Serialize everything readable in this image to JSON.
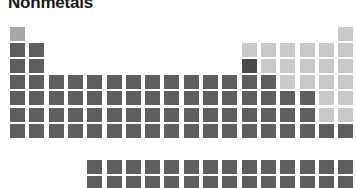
{
  "title": "Nonmetals",
  "chart_data": {
    "type": "heatmap",
    "title": "Nonmetals",
    "subtitle": "",
    "xlabel": "",
    "ylabel": "",
    "legend": [
      {
        "label": "Nonmetal (highlighted)",
        "color": "#c9c9c9"
      },
      {
        "label": "Other element",
        "color": "#5e5e5e"
      }
    ],
    "legend_position": "none",
    "grid": false,
    "colors": {
      "highlight": "#c9c9c9",
      "highlight_mid": "#a8a8a8",
      "base": "#5e5e5e",
      "base_dark": "#4a4a4a",
      "background": "#ffffff",
      "title": "#1a1a1a"
    },
    "layout": {
      "columns": 18,
      "rows": 10,
      "origin_x": 10,
      "origin_y": 27,
      "pitch_x": 19.3,
      "pitch_y": 16.1,
      "cell_w": 15,
      "cell_h": 14,
      "fblock_row_gap": 4,
      "fblock_start_col": 3
    },
    "categories": [
      "col1",
      "col2",
      "col3",
      "col4",
      "col5",
      "col6",
      "col7",
      "col8",
      "col9",
      "col10",
      "col11",
      "col12",
      "col13",
      "col14",
      "col15",
      "col16",
      "col17",
      "col18"
    ],
    "cells": [
      {
        "symbol": "H",
        "z": 1,
        "col": 1,
        "row": 1,
        "value": 1,
        "tone": "highlight_mid"
      },
      {
        "symbol": "He",
        "z": 2,
        "col": 18,
        "row": 1,
        "value": 1,
        "tone": "highlight"
      },
      {
        "symbol": "Li",
        "z": 3,
        "col": 1,
        "row": 2,
        "value": 0,
        "tone": "base"
      },
      {
        "symbol": "Be",
        "z": 4,
        "col": 2,
        "row": 2,
        "value": 0,
        "tone": "base"
      },
      {
        "symbol": "B",
        "z": 5,
        "col": 13,
        "row": 2,
        "value": 1,
        "tone": "highlight"
      },
      {
        "symbol": "C",
        "z": 6,
        "col": 14,
        "row": 2,
        "value": 1,
        "tone": "highlight"
      },
      {
        "symbol": "N",
        "z": 7,
        "col": 15,
        "row": 2,
        "value": 1,
        "tone": "highlight"
      },
      {
        "symbol": "O",
        "z": 8,
        "col": 16,
        "row": 2,
        "value": 1,
        "tone": "highlight"
      },
      {
        "symbol": "F",
        "z": 9,
        "col": 17,
        "row": 2,
        "value": 1,
        "tone": "highlight"
      },
      {
        "symbol": "Ne",
        "z": 10,
        "col": 18,
        "row": 2,
        "value": 1,
        "tone": "highlight"
      },
      {
        "symbol": "Na",
        "z": 11,
        "col": 1,
        "row": 3,
        "value": 0,
        "tone": "base"
      },
      {
        "symbol": "Mg",
        "z": 12,
        "col": 2,
        "row": 3,
        "value": 0,
        "tone": "base"
      },
      {
        "symbol": "Al",
        "z": 13,
        "col": 13,
        "row": 3,
        "value": 0,
        "tone": "base_dark"
      },
      {
        "symbol": "Si",
        "z": 14,
        "col": 14,
        "row": 3,
        "value": 1,
        "tone": "highlight"
      },
      {
        "symbol": "P",
        "z": 15,
        "col": 15,
        "row": 3,
        "value": 1,
        "tone": "highlight"
      },
      {
        "symbol": "S",
        "z": 16,
        "col": 16,
        "row": 3,
        "value": 1,
        "tone": "highlight"
      },
      {
        "symbol": "Cl",
        "z": 17,
        "col": 17,
        "row": 3,
        "value": 1,
        "tone": "highlight"
      },
      {
        "symbol": "Ar",
        "z": 18,
        "col": 18,
        "row": 3,
        "value": 1,
        "tone": "highlight"
      },
      {
        "symbol": "K",
        "z": 19,
        "col": 1,
        "row": 4,
        "value": 0,
        "tone": "base"
      },
      {
        "symbol": "Ca",
        "z": 20,
        "col": 2,
        "row": 4,
        "value": 0,
        "tone": "base"
      },
      {
        "symbol": "Sc",
        "z": 21,
        "col": 3,
        "row": 4,
        "value": 0,
        "tone": "base"
      },
      {
        "symbol": "Ti",
        "z": 22,
        "col": 4,
        "row": 4,
        "value": 0,
        "tone": "base"
      },
      {
        "symbol": "V",
        "z": 23,
        "col": 5,
        "row": 4,
        "value": 0,
        "tone": "base"
      },
      {
        "symbol": "Cr",
        "z": 24,
        "col": 6,
        "row": 4,
        "value": 0,
        "tone": "base"
      },
      {
        "symbol": "Mn",
        "z": 25,
        "col": 7,
        "row": 4,
        "value": 0,
        "tone": "base"
      },
      {
        "symbol": "Fe",
        "z": 26,
        "col": 8,
        "row": 4,
        "value": 0,
        "tone": "base"
      },
      {
        "symbol": "Co",
        "z": 27,
        "col": 9,
        "row": 4,
        "value": 0,
        "tone": "base"
      },
      {
        "symbol": "Ni",
        "z": 28,
        "col": 10,
        "row": 4,
        "value": 0,
        "tone": "base"
      },
      {
        "symbol": "Cu",
        "z": 29,
        "col": 11,
        "row": 4,
        "value": 0,
        "tone": "base"
      },
      {
        "symbol": "Zn",
        "z": 30,
        "col": 12,
        "row": 4,
        "value": 0,
        "tone": "base"
      },
      {
        "symbol": "Ga",
        "z": 31,
        "col": 13,
        "row": 4,
        "value": 0,
        "tone": "base"
      },
      {
        "symbol": "Ge",
        "z": 32,
        "col": 14,
        "row": 4,
        "value": 0,
        "tone": "base"
      },
      {
        "symbol": "As",
        "z": 33,
        "col": 15,
        "row": 4,
        "value": 1,
        "tone": "highlight"
      },
      {
        "symbol": "Se",
        "z": 34,
        "col": 16,
        "row": 4,
        "value": 1,
        "tone": "highlight"
      },
      {
        "symbol": "Br",
        "z": 35,
        "col": 17,
        "row": 4,
        "value": 1,
        "tone": "highlight"
      },
      {
        "symbol": "Kr",
        "z": 36,
        "col": 18,
        "row": 4,
        "value": 1,
        "tone": "highlight"
      },
      {
        "symbol": "Rb",
        "z": 37,
        "col": 1,
        "row": 5,
        "value": 0,
        "tone": "base"
      },
      {
        "symbol": "Sr",
        "z": 38,
        "col": 2,
        "row": 5,
        "value": 0,
        "tone": "base"
      },
      {
        "symbol": "Y",
        "z": 39,
        "col": 3,
        "row": 5,
        "value": 0,
        "tone": "base"
      },
      {
        "symbol": "Zr",
        "z": 40,
        "col": 4,
        "row": 5,
        "value": 0,
        "tone": "base"
      },
      {
        "symbol": "Nb",
        "z": 41,
        "col": 5,
        "row": 5,
        "value": 0,
        "tone": "base"
      },
      {
        "symbol": "Mo",
        "z": 42,
        "col": 6,
        "row": 5,
        "value": 0,
        "tone": "base"
      },
      {
        "symbol": "Tc",
        "z": 43,
        "col": 7,
        "row": 5,
        "value": 0,
        "tone": "base"
      },
      {
        "symbol": "Ru",
        "z": 44,
        "col": 8,
        "row": 5,
        "value": 0,
        "tone": "base"
      },
      {
        "symbol": "Rh",
        "z": 45,
        "col": 9,
        "row": 5,
        "value": 0,
        "tone": "base"
      },
      {
        "symbol": "Pd",
        "z": 46,
        "col": 10,
        "row": 5,
        "value": 0,
        "tone": "base"
      },
      {
        "symbol": "Ag",
        "z": 47,
        "col": 11,
        "row": 5,
        "value": 0,
        "tone": "base"
      },
      {
        "symbol": "Cd",
        "z": 48,
        "col": 12,
        "row": 5,
        "value": 0,
        "tone": "base"
      },
      {
        "symbol": "In",
        "z": 49,
        "col": 13,
        "row": 5,
        "value": 0,
        "tone": "base"
      },
      {
        "symbol": "Sn",
        "z": 50,
        "col": 14,
        "row": 5,
        "value": 0,
        "tone": "base"
      },
      {
        "symbol": "Sb",
        "z": 51,
        "col": 15,
        "row": 5,
        "value": 0,
        "tone": "base"
      },
      {
        "symbol": "Te",
        "z": 52,
        "col": 16,
        "row": 5,
        "value": 0,
        "tone": "base"
      },
      {
        "symbol": "I",
        "z": 53,
        "col": 17,
        "row": 5,
        "value": 1,
        "tone": "highlight"
      },
      {
        "symbol": "Xe",
        "z": 54,
        "col": 18,
        "row": 5,
        "value": 1,
        "tone": "highlight"
      },
      {
        "symbol": "Cs",
        "z": 55,
        "col": 1,
        "row": 6,
        "value": 0,
        "tone": "base"
      },
      {
        "symbol": "Ba",
        "z": 56,
        "col": 2,
        "row": 6,
        "value": 0,
        "tone": "base"
      },
      {
        "symbol": "La",
        "z": 57,
        "col": 3,
        "row": 6,
        "value": 0,
        "tone": "base"
      },
      {
        "symbol": "Hf",
        "z": 72,
        "col": 4,
        "row": 6,
        "value": 0,
        "tone": "base"
      },
      {
        "symbol": "Ta",
        "z": 73,
        "col": 5,
        "row": 6,
        "value": 0,
        "tone": "base"
      },
      {
        "symbol": "W",
        "z": 74,
        "col": 6,
        "row": 6,
        "value": 0,
        "tone": "base"
      },
      {
        "symbol": "Re",
        "z": 75,
        "col": 7,
        "row": 6,
        "value": 0,
        "tone": "base"
      },
      {
        "symbol": "Os",
        "z": 76,
        "col": 8,
        "row": 6,
        "value": 0,
        "tone": "base"
      },
      {
        "symbol": "Ir",
        "z": 77,
        "col": 9,
        "row": 6,
        "value": 0,
        "tone": "base"
      },
      {
        "symbol": "Pt",
        "z": 78,
        "col": 10,
        "row": 6,
        "value": 0,
        "tone": "base"
      },
      {
        "symbol": "Au",
        "z": 79,
        "col": 11,
        "row": 6,
        "value": 0,
        "tone": "base"
      },
      {
        "symbol": "Hg",
        "z": 80,
        "col": 12,
        "row": 6,
        "value": 0,
        "tone": "base"
      },
      {
        "symbol": "Tl",
        "z": 81,
        "col": 13,
        "row": 6,
        "value": 0,
        "tone": "base"
      },
      {
        "symbol": "Pb",
        "z": 82,
        "col": 14,
        "row": 6,
        "value": 0,
        "tone": "base"
      },
      {
        "symbol": "Bi",
        "z": 83,
        "col": 15,
        "row": 6,
        "value": 0,
        "tone": "base"
      },
      {
        "symbol": "Po",
        "z": 84,
        "col": 16,
        "row": 6,
        "value": 0,
        "tone": "base"
      },
      {
        "symbol": "At",
        "z": 85,
        "col": 17,
        "row": 6,
        "value": 1,
        "tone": "highlight"
      },
      {
        "symbol": "Rn",
        "z": 86,
        "col": 18,
        "row": 6,
        "value": 1,
        "tone": "highlight"
      },
      {
        "symbol": "Fr",
        "z": 87,
        "col": 1,
        "row": 7,
        "value": 0,
        "tone": "base"
      },
      {
        "symbol": "Ra",
        "z": 88,
        "col": 2,
        "row": 7,
        "value": 0,
        "tone": "base"
      },
      {
        "symbol": "Ac",
        "z": 89,
        "col": 3,
        "row": 7,
        "value": 0,
        "tone": "base"
      },
      {
        "symbol": "Rf",
        "z": 104,
        "col": 4,
        "row": 7,
        "value": 0,
        "tone": "base"
      },
      {
        "symbol": "Db",
        "z": 105,
        "col": 5,
        "row": 7,
        "value": 0,
        "tone": "base"
      },
      {
        "symbol": "Sg",
        "z": 106,
        "col": 6,
        "row": 7,
        "value": 0,
        "tone": "base"
      },
      {
        "symbol": "Bh",
        "z": 107,
        "col": 7,
        "row": 7,
        "value": 0,
        "tone": "base"
      },
      {
        "symbol": "Hs",
        "z": 108,
        "col": 8,
        "row": 7,
        "value": 0,
        "tone": "base"
      },
      {
        "symbol": "Mt",
        "z": 109,
        "col": 9,
        "row": 7,
        "value": 0,
        "tone": "base"
      },
      {
        "symbol": "Ds",
        "z": 110,
        "col": 10,
        "row": 7,
        "value": 0,
        "tone": "base"
      },
      {
        "symbol": "Rg",
        "z": 111,
        "col": 11,
        "row": 7,
        "value": 0,
        "tone": "base"
      },
      {
        "symbol": "Cn",
        "z": 112,
        "col": 12,
        "row": 7,
        "value": 0,
        "tone": "base"
      },
      {
        "symbol": "Nh",
        "z": 113,
        "col": 13,
        "row": 7,
        "value": 0,
        "tone": "base"
      },
      {
        "symbol": "Fl",
        "z": 114,
        "col": 14,
        "row": 7,
        "value": 0,
        "tone": "base"
      },
      {
        "symbol": "Mc",
        "z": 115,
        "col": 15,
        "row": 7,
        "value": 0,
        "tone": "base"
      },
      {
        "symbol": "Lv",
        "z": 116,
        "col": 16,
        "row": 7,
        "value": 0,
        "tone": "base"
      },
      {
        "symbol": "Ts",
        "z": 117,
        "col": 17,
        "row": 7,
        "value": 0,
        "tone": "base"
      },
      {
        "symbol": "Og",
        "z": 118,
        "col": 18,
        "row": 7,
        "value": 0,
        "tone": "base"
      },
      {
        "symbol": "Ce",
        "z": 58,
        "col": 5,
        "row": 9,
        "value": 0,
        "tone": "base"
      },
      {
        "symbol": "Pr",
        "z": 59,
        "col": 6,
        "row": 9,
        "value": 0,
        "tone": "base"
      },
      {
        "symbol": "Nd",
        "z": 60,
        "col": 7,
        "row": 9,
        "value": 0,
        "tone": "base"
      },
      {
        "symbol": "Pm",
        "z": 61,
        "col": 8,
        "row": 9,
        "value": 0,
        "tone": "base"
      },
      {
        "symbol": "Sm",
        "z": 62,
        "col": 9,
        "row": 9,
        "value": 0,
        "tone": "base"
      },
      {
        "symbol": "Eu",
        "z": 63,
        "col": 10,
        "row": 9,
        "value": 0,
        "tone": "base"
      },
      {
        "symbol": "Gd",
        "z": 64,
        "col": 11,
        "row": 9,
        "value": 0,
        "tone": "base"
      },
      {
        "symbol": "Tb",
        "z": 65,
        "col": 12,
        "row": 9,
        "value": 0,
        "tone": "base"
      },
      {
        "symbol": "Dy",
        "z": 66,
        "col": 13,
        "row": 9,
        "value": 0,
        "tone": "base"
      },
      {
        "symbol": "Ho",
        "z": 67,
        "col": 14,
        "row": 9,
        "value": 0,
        "tone": "base"
      },
      {
        "symbol": "Er",
        "z": 68,
        "col": 15,
        "row": 9,
        "value": 0,
        "tone": "base"
      },
      {
        "symbol": "Tm",
        "z": 69,
        "col": 16,
        "row": 9,
        "value": 0,
        "tone": "base"
      },
      {
        "symbol": "Yb",
        "z": 70,
        "col": 17,
        "row": 9,
        "value": 0,
        "tone": "base"
      },
      {
        "symbol": "Lu",
        "z": 71,
        "col": 18,
        "row": 9,
        "value": 0,
        "tone": "base"
      },
      {
        "symbol": "Th",
        "z": 90,
        "col": 5,
        "row": 10,
        "value": 0,
        "tone": "base"
      },
      {
        "symbol": "Pa",
        "z": 91,
        "col": 6,
        "row": 10,
        "value": 0,
        "tone": "base"
      },
      {
        "symbol": "U",
        "z": 92,
        "col": 7,
        "row": 10,
        "value": 0,
        "tone": "base"
      },
      {
        "symbol": "Np",
        "z": 93,
        "col": 8,
        "row": 10,
        "value": 0,
        "tone": "base"
      },
      {
        "symbol": "Pu",
        "z": 94,
        "col": 9,
        "row": 10,
        "value": 0,
        "tone": "base"
      },
      {
        "symbol": "Am",
        "z": 95,
        "col": 10,
        "row": 10,
        "value": 0,
        "tone": "base"
      },
      {
        "symbol": "Cm",
        "z": 96,
        "col": 11,
        "row": 10,
        "value": 0,
        "tone": "base"
      },
      {
        "symbol": "Bk",
        "z": 97,
        "col": 12,
        "row": 10,
        "value": 0,
        "tone": "base"
      },
      {
        "symbol": "Cf",
        "z": 98,
        "col": 13,
        "row": 10,
        "value": 0,
        "tone": "base"
      },
      {
        "symbol": "Es",
        "z": 99,
        "col": 14,
        "row": 10,
        "value": 0,
        "tone": "base"
      },
      {
        "symbol": "Fm",
        "z": 100,
        "col": 15,
        "row": 10,
        "value": 0,
        "tone": "base"
      },
      {
        "symbol": "Md",
        "z": 101,
        "col": 16,
        "row": 10,
        "value": 0,
        "tone": "base"
      },
      {
        "symbol": "No",
        "z": 102,
        "col": 17,
        "row": 10,
        "value": 0,
        "tone": "base"
      },
      {
        "symbol": "Lr",
        "z": 103,
        "col": 18,
        "row": 10,
        "value": 0,
        "tone": "base"
      }
    ]
  }
}
